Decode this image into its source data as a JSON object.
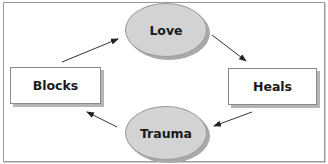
{
  "diagram": {
    "type": "cycle",
    "nodes": [
      {
        "id": "love",
        "label": "Love",
        "shape": "ellipse"
      },
      {
        "id": "heals",
        "label": "Heals",
        "shape": "rectangle"
      },
      {
        "id": "trauma",
        "label": "Trauma",
        "shape": "ellipse"
      },
      {
        "id": "blocks",
        "label": "Blocks",
        "shape": "rectangle"
      }
    ],
    "edges": [
      {
        "from": "love",
        "to": "heals"
      },
      {
        "from": "heals",
        "to": "trauma"
      },
      {
        "from": "trauma",
        "to": "blocks"
      },
      {
        "from": "blocks",
        "to": "love"
      }
    ],
    "colors": {
      "ellipse_fill": "#d3d3d3",
      "box_fill": "#ffffff",
      "border": "#8a8a8a",
      "arrow": "#222222"
    }
  }
}
